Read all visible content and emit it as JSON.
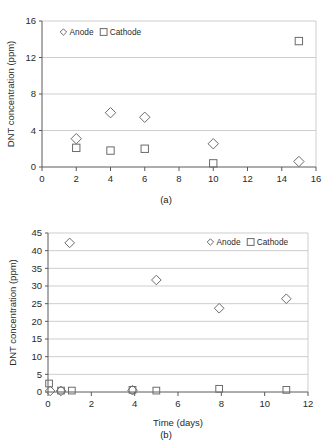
{
  "figure": {
    "panels": [
      {
        "caption": "(a)",
        "chart_data": {
          "type": "scatter",
          "title": "",
          "xlabel": "Time (days)",
          "ylabel": "DNT concentration (ppm)",
          "xlim": [
            0,
            16
          ],
          "ylim": [
            0,
            16
          ],
          "xticks": [
            "0",
            "2",
            "4",
            "6",
            "8",
            "10",
            "12",
            "14",
            "16"
          ],
          "yticks": [
            "0",
            "4",
            "8",
            "12",
            "16"
          ],
          "grid": "horizontal",
          "legend_position": "top-left",
          "series": [
            {
              "name": "Anode",
              "marker": "diamond",
              "points": [
                {
                  "x": 2,
                  "y": 3.1
                },
                {
                  "x": 4,
                  "y": 5.95
                },
                {
                  "x": 6,
                  "y": 5.45
                },
                {
                  "x": 10,
                  "y": 2.55
                },
                {
                  "x": 15,
                  "y": 0.6
                }
              ]
            },
            {
              "name": "Cathode",
              "marker": "square",
              "points": [
                {
                  "x": 2,
                  "y": 2.1
                },
                {
                  "x": 4,
                  "y": 1.8
                },
                {
                  "x": 6,
                  "y": 2.0
                },
                {
                  "x": 10,
                  "y": 0.4
                },
                {
                  "x": 15,
                  "y": 13.8
                }
              ]
            }
          ]
        }
      },
      {
        "caption": "(b)",
        "chart_data": {
          "type": "scatter",
          "title": "",
          "xlabel": "Time (days)",
          "ylabel": "DNT concentration (ppm)",
          "xlim": [
            0,
            12
          ],
          "ylim": [
            0,
            45
          ],
          "xticks": [
            "0",
            "2",
            "4",
            "6",
            "8",
            "10",
            "12"
          ],
          "yticks": [
            "0",
            "5",
            "10",
            "15",
            "20",
            "25",
            "30",
            "35",
            "40",
            "45"
          ],
          "grid": "horizontal",
          "legend_position": "top-right",
          "series": [
            {
              "name": "Anode",
              "marker": "diamond",
              "points": [
                {
                  "x": 0.1,
                  "y": 0.3
                },
                {
                  "x": 0.6,
                  "y": 0.3
                },
                {
                  "x": 1.0,
                  "y": 42.2
                },
                {
                  "x": 3.9,
                  "y": 0.5
                },
                {
                  "x": 5.0,
                  "y": 31.7
                },
                {
                  "x": 7.9,
                  "y": 23.7
                },
                {
                  "x": 11.0,
                  "y": 26.4
                }
              ]
            },
            {
              "name": "Cathode",
              "marker": "square",
              "points": [
                {
                  "x": 0.05,
                  "y": 2.4
                },
                {
                  "x": 0.6,
                  "y": 0.4
                },
                {
                  "x": 1.1,
                  "y": 0.4
                },
                {
                  "x": 3.9,
                  "y": 0.6
                },
                {
                  "x": 5.0,
                  "y": 0.4
                },
                {
                  "x": 7.9,
                  "y": 0.9
                },
                {
                  "x": 11.0,
                  "y": 0.6
                }
              ]
            }
          ]
        }
      }
    ]
  }
}
